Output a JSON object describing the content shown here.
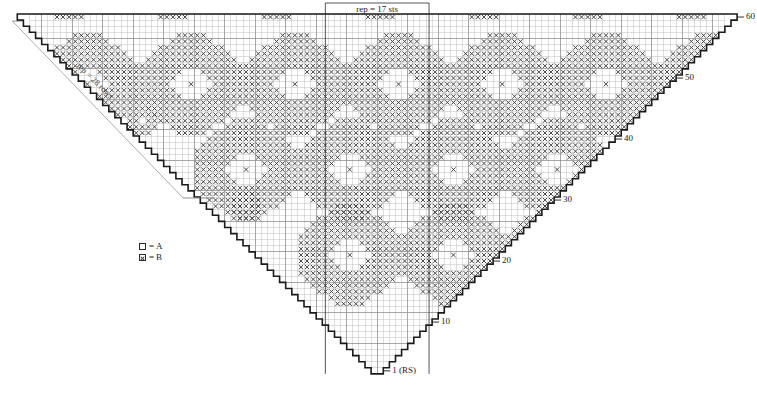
{
  "chart_data": {
    "type": "table",
    "grid": {
      "cell_size": 6.1,
      "origin_x": 29.5,
      "origin_y": 14.0,
      "columns": 114,
      "rows": 59,
      "shape": "inverted-triangle",
      "heavy_line_every": 5,
      "grid_color": "#b9b9b9",
      "heavy_grid_color": "#8a8a8a",
      "outline_color": "#1a1a1a",
      "symbol_color": "#3a3a3a"
    },
    "legend": [
      {
        "symbol": "empty-square",
        "eq": "=",
        "label": "A"
      },
      {
        "symbol": "crossed-square",
        "eq": "=",
        "label": "B"
      }
    ],
    "row_labels": [
      {
        "text": "60",
        "row": 59,
        "x": 726,
        "y": 56
      },
      {
        "text": "50",
        "row": 49,
        "x": 665,
        "y": 117
      },
      {
        "text": "40",
        "row": 39,
        "x": 604,
        "y": 178
      },
      {
        "text": "30",
        "row": 29,
        "x": 543,
        "y": 239
      },
      {
        "text": "20",
        "row": 19,
        "x": 482,
        "y": 270
      },
      {
        "text": "10",
        "row": 9,
        "x": 421,
        "y": 331
      },
      {
        "text": "1 (RS)",
        "row": 1,
        "x": 384,
        "y": 380
      }
    ],
    "annotations": {
      "rep_sts": {
        "text": "rep = 17 sts",
        "x": 352,
        "y": 4,
        "bracket_left": 330,
        "bracket_right": 434,
        "bracket_top": 3
      },
      "rep_rows": {
        "text": "rep = 28 rows",
        "x": 72,
        "y": 92,
        "rotation_deg": 44
      }
    },
    "motif": {
      "name": "ring-medallion",
      "width_cells": 17,
      "height_cells": 17,
      "description": "Octagonal ring of B symbols with hollow A center and single B stitch at center",
      "rows_filled": [
        "00000011111000000",
        "00000111111100000",
        "00011111111111000",
        "00111111111111100",
        "01111111111111110",
        "11111111111111111",
        "11111110001111111",
        "11111100000111111",
        "11111000100011111",
        "11111100000111111",
        "11111110001111111",
        "11111111111111111",
        "01111111111111110",
        "00111111111111100",
        "00011111111111000",
        "00000111111100000",
        "00000011111000000"
      ]
    },
    "small_motif": {
      "name": "small-ring",
      "width_cells": 9,
      "height_cells": 9,
      "rows_filled": [
        "000111000",
        "001111100",
        "011111110",
        "111101111",
        "111010111",
        "111101111",
        "011111110",
        "001111100",
        "000111000"
      ]
    },
    "tiny_motif": {
      "name": "tiny-ring",
      "width_cells": 5,
      "height_cells": 5,
      "rows_filled": [
        "01110",
        "11111",
        "11011",
        "11111",
        "01110"
      ]
    },
    "edge_motif": {
      "name": "top-edge-dash",
      "width_cells": 5,
      "height_cells": 1,
      "rows_filled": [
        "11111"
      ]
    },
    "motif_placements": [
      {
        "type": "ring-medallion",
        "col": 26,
        "row_top": 55
      },
      {
        "type": "ring-medallion",
        "col": 43,
        "row_top": 55
      },
      {
        "type": "ring-medallion",
        "col": 60,
        "row_top": 55
      },
      {
        "type": "ring-medallion",
        "col": 77,
        "row_top": 55
      },
      {
        "type": "ring-medallion",
        "col": 94,
        "row_top": 55
      },
      {
        "type": "ring-medallion",
        "col": 111,
        "row_top": 55
      },
      {
        "type": "ring-medallion",
        "col": 52,
        "row_top": 41
      },
      {
        "type": "ring-medallion",
        "col": 69,
        "row_top": 41
      },
      {
        "type": "ring-medallion",
        "col": 86,
        "row_top": 41
      },
      {
        "type": "ring-medallion",
        "col": 103,
        "row_top": 41
      },
      {
        "type": "ring-medallion",
        "col": 69,
        "row_top": 27
      },
      {
        "type": "ring-medallion",
        "col": 86,
        "row_top": 27
      },
      {
        "type": "ring-medallion",
        "col": 77,
        "row_top": 13
      }
    ],
    "axis_note": "Right-hand numbers mark odd right-side rows counting from bottom tip (row 1 RS) upward"
  },
  "ui": {
    "page_title": "Knitting Chart"
  }
}
